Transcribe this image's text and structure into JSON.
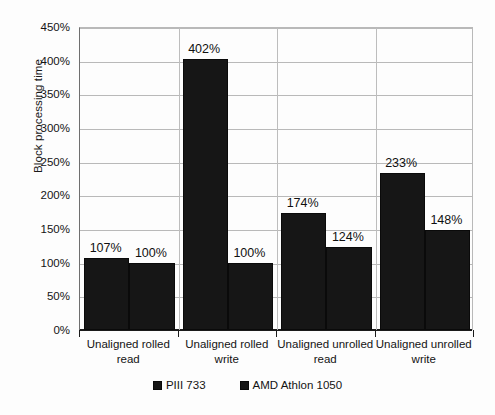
{
  "chart_data": {
    "type": "bar",
    "title": "",
    "xlabel": "",
    "ylabel": "Block processing time",
    "ylim": [
      0,
      450
    ],
    "ytick_labels": [
      "0%",
      "50%",
      "100%",
      "150%",
      "200%",
      "250%",
      "300%",
      "350%",
      "400%",
      "450%"
    ],
    "ytick_values": [
      0,
      50,
      100,
      150,
      200,
      250,
      300,
      350,
      400,
      450
    ],
    "grid": "horizontal-and-category-separators",
    "legend_position": "bottom-center",
    "categories": [
      "Unaligned rolled read",
      "Unaligned rolled write",
      "Unaligned unrolled read",
      "Unaligned unrolled write"
    ],
    "category_lines": [
      [
        "Unaligned rolled",
        "read"
      ],
      [
        "Unaligned rolled",
        "write"
      ],
      [
        "Unaligned unrolled",
        "read"
      ],
      [
        "Unaligned unrolled",
        "write"
      ]
    ],
    "series": [
      {
        "name": "PIII 733",
        "color": "#161616",
        "values": [
          107,
          402,
          174,
          233
        ],
        "labels": [
          "107%",
          "402%",
          "174%",
          "233%"
        ]
      },
      {
        "name": "AMD Athlon 1050",
        "color": "#161616",
        "values": [
          100,
          100,
          124,
          148
        ],
        "labels": [
          "100%",
          "100%",
          "124%",
          "148%"
        ]
      }
    ]
  },
  "legend": {
    "items": [
      {
        "label": "PIII 733"
      },
      {
        "label": "AMD Athlon 1050"
      }
    ]
  }
}
